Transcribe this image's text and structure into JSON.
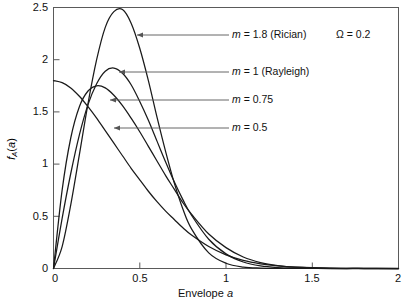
{
  "chart_data": {
    "type": "line",
    "title": "",
    "xlabel": "Envelope a",
    "ylabel": "f_A(a)",
    "xlim": [
      0,
      2
    ],
    "ylim": [
      0,
      2.5
    ],
    "xticks": [
      "0",
      "0.5",
      "1",
      "1.5",
      "2"
    ],
    "xtick_values": [
      0,
      0.5,
      1,
      1.5,
      2
    ],
    "yticks": [
      "0",
      "0.5",
      "1",
      "1.5",
      "2",
      "2.5"
    ],
    "ytick_values": [
      0,
      0.5,
      1,
      1.5,
      2,
      2.5
    ],
    "grid": false,
    "legend_position": "inline-annotations",
    "parameter_note": "Ω = 0.2",
    "series": [
      {
        "name": "m = 1.8 (Rician)",
        "m": 1.8,
        "omega": 0.2,
        "peak_x": 0.41,
        "peak_y": 2.48,
        "x": [
          0,
          0.05,
          0.1,
          0.15,
          0.2,
          0.25,
          0.3,
          0.35,
          0.4,
          0.45,
          0.5,
          0.55,
          0.6,
          0.65,
          0.7,
          0.75,
          0.8,
          0.9,
          1.0,
          1.1,
          1.2,
          1.3,
          1.4,
          1.6,
          1.8,
          2.0
        ],
        "values": [
          0,
          0.21,
          0.61,
          1.09,
          1.58,
          2.0,
          2.31,
          2.46,
          2.48,
          2.35,
          2.11,
          1.8,
          1.45,
          1.12,
          0.82,
          0.57,
          0.38,
          0.15,
          0.05,
          0.014,
          0.004,
          0.001,
          0.0002,
          0,
          0,
          0
        ]
      },
      {
        "name": "m = 1 (Rayleigh)",
        "m": 1.0,
        "omega": 0.2,
        "peak_x": 0.33,
        "peak_y": 1.92,
        "x": [
          0,
          0.05,
          0.1,
          0.15,
          0.2,
          0.25,
          0.3,
          0.35,
          0.4,
          0.45,
          0.5,
          0.55,
          0.6,
          0.65,
          0.7,
          0.75,
          0.8,
          0.9,
          1.0,
          1.1,
          1.2,
          1.3,
          1.4,
          1.6,
          1.8,
          2.0
        ],
        "values": [
          0,
          0.48,
          0.91,
          1.28,
          1.57,
          1.77,
          1.89,
          1.92,
          1.87,
          1.76,
          1.6,
          1.42,
          1.22,
          1.02,
          0.83,
          0.66,
          0.51,
          0.28,
          0.14,
          0.062,
          0.025,
          0.009,
          0.003,
          0.0003,
          0,
          0
        ]
      },
      {
        "name": "m = 0.75",
        "m": 0.75,
        "omega": 0.2,
        "peak_x": 0.28,
        "peak_y": 1.75,
        "x": [
          0,
          0.05,
          0.1,
          0.15,
          0.2,
          0.25,
          0.3,
          0.35,
          0.4,
          0.45,
          0.5,
          0.55,
          0.6,
          0.65,
          0.7,
          0.75,
          0.8,
          0.9,
          1.0,
          1.1,
          1.2,
          1.3,
          1.4,
          1.6,
          1.8,
          2.0
        ],
        "values": [
          0,
          0.75,
          1.25,
          1.55,
          1.7,
          1.75,
          1.73,
          1.66,
          1.56,
          1.44,
          1.31,
          1.17,
          1.03,
          0.89,
          0.76,
          0.63,
          0.52,
          0.33,
          0.2,
          0.11,
          0.057,
          0.028,
          0.013,
          0.002,
          0.0003,
          0
        ]
      },
      {
        "name": "m = 0.5",
        "m": 0.5,
        "omega": 0.2,
        "peak_x": 0.0,
        "peak_y": 1.8,
        "x": [
          0,
          0.05,
          0.1,
          0.15,
          0.2,
          0.25,
          0.3,
          0.35,
          0.4,
          0.45,
          0.5,
          0.55,
          0.6,
          0.65,
          0.7,
          0.75,
          0.8,
          0.9,
          1.0,
          1.1,
          1.2,
          1.3,
          1.4,
          1.6,
          1.8,
          2.0
        ],
        "values": [
          1.8,
          1.78,
          1.73,
          1.65,
          1.55,
          1.44,
          1.32,
          1.2,
          1.08,
          0.96,
          0.85,
          0.74,
          0.64,
          0.55,
          0.47,
          0.39,
          0.32,
          0.21,
          0.13,
          0.077,
          0.044,
          0.024,
          0.013,
          0.003,
          0.0006,
          0.0001
        ]
      }
    ],
    "annotations": [
      {
        "text_m": "m",
        "text_rest": " = 1.8 (Rician)",
        "label": "m = 1.8 (Rician)"
      },
      {
        "text_m": "m",
        "text_rest": " = 1 (Rayleigh)",
        "label": "m = 1 (Rayleigh)"
      },
      {
        "text_m": "m",
        "text_rest": " = 0.75",
        "label": "m = 0.75"
      },
      {
        "text_m": "m",
        "text_rest": " = 0.5",
        "label": "m = 0.5"
      }
    ],
    "omega_label": {
      "symbol": "Ω",
      "rest": " = 0.2"
    }
  },
  "axes": {
    "xlabel_prefix": "Envelope ",
    "xlabel_italic": "a",
    "ylabel_f": "f",
    "ylabel_sub": "A",
    "ylabel_paren_open": "(",
    "ylabel_arg": "a",
    "ylabel_paren_close": ")"
  },
  "colors": {
    "background": "#ffffff",
    "curve": "#1a1a1a",
    "axis": "#4d4d4d",
    "text": "#111111",
    "arrow": "#555555"
  }
}
